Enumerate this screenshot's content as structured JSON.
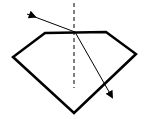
{
  "diagram": {
    "width": 147,
    "height": 119,
    "colors": {
      "stroke": "#000000",
      "background": "#ffffff"
    },
    "gem_outline": {
      "points": [
        [
          45,
          33
        ],
        [
          106,
          32
        ],
        [
          136,
          54
        ],
        [
          74,
          113
        ],
        [
          13,
          57
        ]
      ],
      "stroke_width": 2.5
    },
    "normal_line": {
      "x1": 74,
      "y1": 3,
      "x2": 74,
      "y2": 88,
      "dash": "4,3"
    },
    "incident_ray": {
      "x1": 27,
      "y1": 14,
      "x2": 75,
      "y2": 32,
      "arrow_at": [
        33,
        16
      ]
    },
    "refracted_ray": {
      "x1": 75,
      "y1": 32,
      "x2": 112,
      "y2": 97
    }
  }
}
